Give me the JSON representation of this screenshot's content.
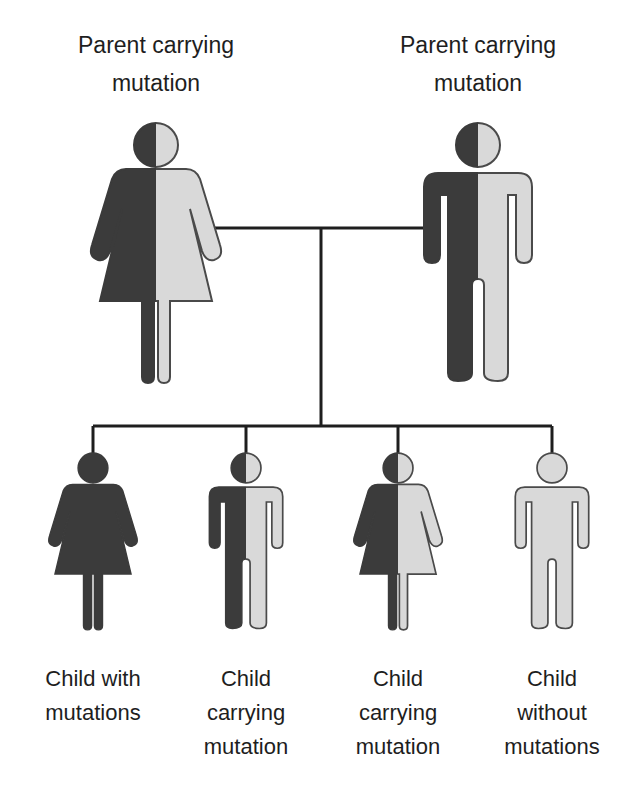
{
  "colors": {
    "affected": "#3b3b3b",
    "unaffected": "#d9d9d9",
    "outline": "#4a4a4a",
    "line": "#1e1e1e"
  },
  "parents": [
    {
      "id": "mother",
      "sex": "female",
      "status": "carrier",
      "label_lines": [
        "Parent carrying",
        "mutation"
      ]
    },
    {
      "id": "father",
      "sex": "male",
      "status": "carrier",
      "label_lines": [
        "Parent carrying",
        "mutation"
      ]
    }
  ],
  "children": [
    {
      "id": "child-1",
      "sex": "female",
      "status": "affected",
      "label_lines": [
        "Child with",
        "mutations"
      ]
    },
    {
      "id": "child-2",
      "sex": "male",
      "status": "carrier",
      "label_lines": [
        "Child",
        "carrying",
        "mutation"
      ]
    },
    {
      "id": "child-3",
      "sex": "female",
      "status": "carrier",
      "label_lines": [
        "Child",
        "carrying",
        "mutation"
      ]
    },
    {
      "id": "child-4",
      "sex": "male",
      "status": "unaffected",
      "label_lines": [
        "Child",
        "without",
        "mutations"
      ]
    }
  ]
}
